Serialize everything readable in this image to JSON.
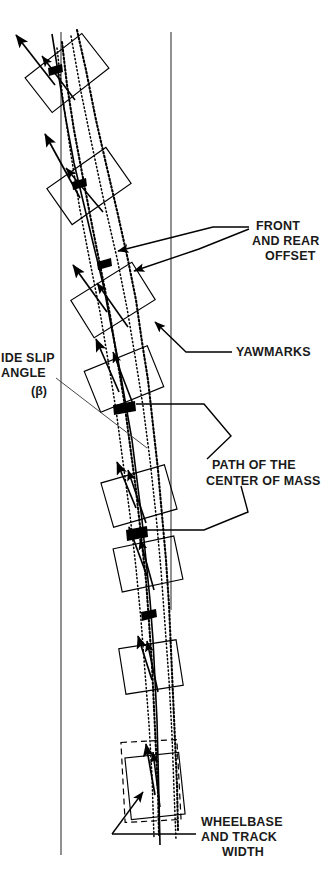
{
  "figure": {
    "type": "technical-diagram",
    "background_color": "#ffffff",
    "ink_color": "#000000",
    "reference_line_color": "#555555",
    "width": 333,
    "height": 887
  },
  "annotations": [
    {
      "id": "front-and-rear-offset",
      "lines": [
        "FRONT",
        "AND REAR",
        "OFFSET"
      ],
      "text_x": 252,
      "text_y": 230,
      "align": "start"
    },
    {
      "id": "yawmarks",
      "lines": [
        "YAWMARKS"
      ],
      "text_x": 236,
      "text_y": 356,
      "align": "start"
    },
    {
      "id": "side-slip-angle",
      "lines": [
        "IDE SLIP",
        "ANGLE",
        "(β)"
      ],
      "text_x": 2,
      "text_y": 362,
      "align": "start"
    },
    {
      "id": "path-of-the-center-of-mass",
      "lines": [
        "PATH OF THE",
        "CENTER OF MASS"
      ],
      "text_x": 211,
      "text_y": 469,
      "align": "start"
    },
    {
      "id": "wheelbase-and-track-width",
      "lines": [
        "WHEELBASE",
        "AND TRACK",
        "WIDTH"
      ],
      "text_x": 200,
      "text_y": 826,
      "align": "start"
    }
  ],
  "reference_lines": [
    {
      "id": "reference-line-left",
      "x1": 61,
      "y1": 32,
      "x2": 61,
      "y2": 855
    },
    {
      "id": "reference-line-right",
      "x1": 171,
      "y1": 32,
      "x2": 171,
      "y2": 610
    }
  ],
  "vehicle_positions": [
    {
      "id": "vehicle-1",
      "cx": 67,
      "cy": 73,
      "w": 72,
      "h": 44,
      "rot": -38
    },
    {
      "id": "vehicle-2",
      "cx": 89,
      "cy": 186,
      "w": 72,
      "h": 44,
      "rot": -35
    },
    {
      "id": "vehicle-3",
      "cx": 113,
      "cy": 300,
      "w": 72,
      "h": 44,
      "rot": -32
    },
    {
      "id": "vehicle-4",
      "cx": 124,
      "cy": 379,
      "w": 68,
      "h": 44,
      "rot": -22
    },
    {
      "id": "vehicle-5",
      "cx": 139,
      "cy": 496,
      "w": 66,
      "h": 46,
      "rot": -16
    },
    {
      "id": "vehicle-6",
      "cx": 148,
      "cy": 564,
      "w": 62,
      "h": 44,
      "rot": -12
    },
    {
      "id": "vehicle-7",
      "cx": 151,
      "cy": 667,
      "w": 58,
      "h": 46,
      "rot": -9
    },
    {
      "id": "vehicle-8",
      "cx": 155,
      "cy": 786,
      "w": 54,
      "h": 62,
      "rot": -6
    }
  ],
  "wheelbase_box": {
    "id": "wheelbase-track-box",
    "cx": 151,
    "cy": 781,
    "w": 56,
    "h": 80,
    "rot": -3,
    "style": "dashed"
  },
  "velocity_vectors": [
    {
      "id": "vector-1",
      "x1": 55,
      "y1": 85,
      "x2": 14,
      "y2": 33
    },
    {
      "id": "vector-2",
      "x1": 80,
      "y1": 198,
      "x2": 44,
      "y2": 132
    },
    {
      "id": "vector-3",
      "x1": 107,
      "y1": 312,
      "x2": 72,
      "y2": 263
    },
    {
      "id": "vector-4",
      "x1": 119,
      "y1": 392,
      "x2": 95,
      "y2": 337
    },
    {
      "id": "vector-5",
      "x1": 136,
      "y1": 508,
      "x2": 116,
      "y2": 460
    },
    {
      "id": "vector-6",
      "x1": 147,
      "y1": 576,
      "x2": 128,
      "y2": 525
    },
    {
      "id": "vector-7",
      "x1": 152,
      "y1": 680,
      "x2": 137,
      "y2": 634
    },
    {
      "id": "vector-8",
      "x1": 155,
      "y1": 795,
      "x2": 145,
      "y2": 742
    }
  ],
  "center_of_mass_path": {
    "id": "path-of-mass-polyline",
    "points": "52,34 66,120 84,205 104,288 118,360 132,440 142,520 150,600 155,680 158,760 160,840"
  },
  "yawmarks": [
    {
      "id": "yawmark-outer",
      "points": "77,30 96,120 118,215 136,300 148,380 158,470 166,560 171,650 175,740 178,830"
    },
    {
      "id": "yawmark-inner",
      "points": "62,42 74,130 92,225 110,315 124,400 136,490 146,580 152,665 156,750 159,835"
    }
  ],
  "leader_lines": [
    {
      "id": "leader-front-offset-a",
      "points": "249,227 213,227 111,251"
    },
    {
      "id": "leader-front-offset-b",
      "points": "249,229 199,248 128,271"
    },
    {
      "id": "leader-yawmarks",
      "points": "232,352 186,352 151,325"
    },
    {
      "id": "leader-path-mass-top",
      "points": "205,459 230,438 203,404 136,404"
    },
    {
      "id": "leader-path-mass-bot",
      "points": "240,486 247,512 203,530 142,530"
    },
    {
      "id": "leader-wheelbase",
      "points": "196,834 112,834"
    },
    {
      "id": "leader-wheelbase-v",
      "points": "112,834 143,792"
    },
    {
      "id": "leader-sideslip",
      "points": "56,378 146,447"
    }
  ]
}
